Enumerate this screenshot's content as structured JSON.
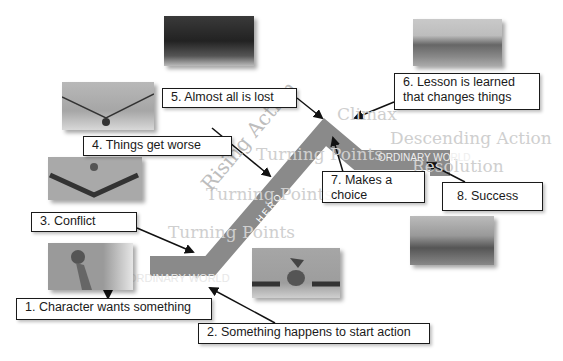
{
  "diagram": {
    "stages": [
      {
        "id": "ordinary-world-start",
        "label": "ORDINARY WORLD"
      },
      {
        "id": "rising-action",
        "label": "Rising Action"
      },
      {
        "id": "climax",
        "label": "Climax"
      },
      {
        "id": "descending-action",
        "label": "Descending Action"
      },
      {
        "id": "resolution",
        "label": "Resolution"
      },
      {
        "id": "ordinary-world-end",
        "label": "ORDINARY WORLD"
      }
    ],
    "watermarks": {
      "turning_points": "Turning Points",
      "climax": "Climax",
      "descending": "Descending Action",
      "resolution": "Resolution",
      "ordinary_world": "ORDINARY WORLD",
      "ordinary_world_2": "ORDINARY WORLD",
      "rising": "Rising Action",
      "hero": "H E R O"
    },
    "steps": [
      {
        "n": 1,
        "text": "1. Character wants something"
      },
      {
        "n": 2,
        "text": "2. Something happens to start action"
      },
      {
        "n": 3,
        "text": "3. Conflict"
      },
      {
        "n": 4,
        "text": "4. Things get worse"
      },
      {
        "n": 5,
        "text": "5. Almost all is lost"
      },
      {
        "n": 6,
        "line1": "6. Lesson is learned",
        "line2": "that changes things"
      },
      {
        "n": 7,
        "line1": "7. Makes a",
        "line2": "choice"
      },
      {
        "n": 8,
        "text": "8. Success"
      }
    ],
    "images": [
      {
        "id": "img-character",
        "desc": "character bird looking up"
      },
      {
        "id": "img-bird-start",
        "desc": "bird standing between crowds"
      },
      {
        "id": "img-conflict",
        "desc": "birds lined up in V"
      },
      {
        "id": "img-worse",
        "desc": "birds on sagging wire"
      },
      {
        "id": "img-lost",
        "desc": "dark close-up of birds"
      },
      {
        "id": "img-lesson",
        "desc": "field scene"
      },
      {
        "id": "img-success",
        "desc": "bird in grass"
      }
    ],
    "colors": {
      "arc": "#8a8a8a",
      "arc_light": "#b5b5b5",
      "box_border": "#1a1a1a",
      "watermark": "#cfcfcf"
    }
  }
}
